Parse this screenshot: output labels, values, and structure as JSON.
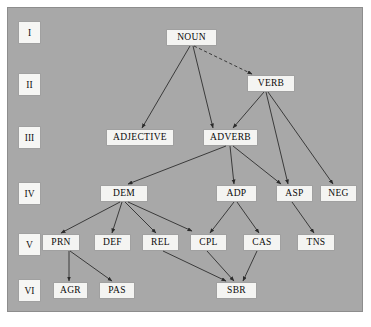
{
  "diagram": {
    "type": "hierarchy-tree",
    "background_color": "#a8a8a8",
    "node_color": "#f4f4f2",
    "line_color": "#2e2e2e",
    "row_labels": [
      {
        "id": "row-1",
        "text": "I",
        "x": 19,
        "y": 22
      },
      {
        "id": "row-2",
        "text": "II",
        "x": 19,
        "y": 74
      },
      {
        "id": "row-3",
        "text": "III",
        "x": 19,
        "y": 127
      },
      {
        "id": "row-4",
        "text": "IV",
        "x": 19,
        "y": 183
      },
      {
        "id": "row-5",
        "text": "V",
        "x": 19,
        "y": 234
      },
      {
        "id": "row-6",
        "text": "VI",
        "x": 19,
        "y": 280
      }
    ],
    "nodes": [
      {
        "id": "noun",
        "label": "NOUN",
        "row": "I",
        "x": 167,
        "y": 30,
        "w": 49,
        "h": 15
      },
      {
        "id": "verb",
        "label": "VERB",
        "row": "II",
        "x": 248,
        "y": 76,
        "w": 46,
        "h": 15
      },
      {
        "id": "adjective",
        "label": "ADJECTIVE",
        "row": "III",
        "x": 107,
        "y": 130,
        "w": 66,
        "h": 15
      },
      {
        "id": "adverb",
        "label": "ADVERB",
        "row": "III",
        "x": 204,
        "y": 130,
        "w": 53,
        "h": 15
      },
      {
        "id": "dem",
        "label": "DEM",
        "row": "IV",
        "x": 101,
        "y": 186,
        "w": 46,
        "h": 15
      },
      {
        "id": "adp",
        "label": "ADP",
        "row": "IV",
        "x": 217,
        "y": 186,
        "w": 39,
        "h": 15
      },
      {
        "id": "asp",
        "label": "ASP",
        "row": "IV",
        "x": 277,
        "y": 186,
        "w": 35,
        "h": 15
      },
      {
        "id": "neg",
        "label": "NEG",
        "row": "IV",
        "x": 321,
        "y": 186,
        "w": 35,
        "h": 15
      },
      {
        "id": "prn",
        "label": "PRN",
        "row": "V",
        "x": 43,
        "y": 235,
        "w": 36,
        "h": 15
      },
      {
        "id": "def",
        "label": "DEF",
        "row": "V",
        "x": 95,
        "y": 235,
        "w": 35,
        "h": 15
      },
      {
        "id": "rel",
        "label": "REL",
        "row": "V",
        "x": 143,
        "y": 235,
        "w": 35,
        "h": 15
      },
      {
        "id": "cpl",
        "label": "CPL",
        "row": "V",
        "x": 191,
        "y": 235,
        "w": 35,
        "h": 15
      },
      {
        "id": "cas",
        "label": "CAS",
        "row": "V",
        "x": 244,
        "y": 235,
        "w": 36,
        "h": 15
      },
      {
        "id": "tns",
        "label": "TNS",
        "row": "V",
        "x": 298,
        "y": 235,
        "w": 36,
        "h": 15
      },
      {
        "id": "agr",
        "label": "AGR",
        "row": "VI",
        "x": 54,
        "y": 283,
        "w": 33,
        "h": 15
      },
      {
        "id": "pas",
        "label": "PAS",
        "row": "VI",
        "x": 100,
        "y": 283,
        "w": 34,
        "h": 15
      },
      {
        "id": "sbr",
        "label": "SBR",
        "row": "VI",
        "x": 217,
        "y": 283,
        "w": 39,
        "h": 15
      }
    ],
    "edges": [
      {
        "id": "edge-noun-verb",
        "from": "noun",
        "to": "verb",
        "style": "dashed",
        "x1": 194,
        "y1": 46,
        "x2": 252,
        "y2": 74
      },
      {
        "id": "edge-noun-adjective",
        "from": "noun",
        "to": "adjective",
        "style": "solid",
        "x1": 190,
        "y1": 46,
        "x2": 142,
        "y2": 128
      },
      {
        "id": "edge-noun-adverb",
        "from": "noun",
        "to": "adverb",
        "style": "solid",
        "x1": 193,
        "y1": 46,
        "x2": 213,
        "y2": 128
      },
      {
        "id": "edge-verb-adverb",
        "from": "verb",
        "to": "adverb",
        "style": "solid",
        "x1": 264,
        "y1": 92,
        "x2": 233,
        "y2": 128
      },
      {
        "id": "edge-verb-asp",
        "from": "verb",
        "to": "asp",
        "style": "solid",
        "x1": 266,
        "y1": 92,
        "x2": 288,
        "y2": 184
      },
      {
        "id": "edge-verb-neg",
        "from": "verb",
        "to": "neg",
        "style": "solid",
        "x1": 268,
        "y1": 92,
        "x2": 333,
        "y2": 184
      },
      {
        "id": "edge-adverb-dem",
        "from": "adverb",
        "to": "dem",
        "style": "solid",
        "x1": 226,
        "y1": 146,
        "x2": 128,
        "y2": 184
      },
      {
        "id": "edge-adverb-adp",
        "from": "adverb",
        "to": "adp",
        "style": "solid",
        "x1": 230,
        "y1": 146,
        "x2": 234,
        "y2": 184
      },
      {
        "id": "edge-adverb-asp",
        "from": "adverb",
        "to": "asp",
        "style": "solid",
        "x1": 233,
        "y1": 146,
        "x2": 281,
        "y2": 184
      },
      {
        "id": "edge-dem-prn",
        "from": "dem",
        "to": "prn",
        "style": "solid",
        "x1": 120,
        "y1": 202,
        "x2": 61,
        "y2": 233
      },
      {
        "id": "edge-dem-def",
        "from": "dem",
        "to": "def",
        "style": "solid",
        "x1": 122,
        "y1": 202,
        "x2": 112,
        "y2": 233
      },
      {
        "id": "edge-dem-rel",
        "from": "dem",
        "to": "rel",
        "style": "solid",
        "x1": 125,
        "y1": 202,
        "x2": 156,
        "y2": 233
      },
      {
        "id": "edge-dem-cpl",
        "from": "dem",
        "to": "cpl",
        "style": "solid",
        "x1": 128,
        "y1": 202,
        "x2": 192,
        "y2": 231
      },
      {
        "id": "edge-adp-cpl",
        "from": "adp",
        "to": "cpl",
        "style": "solid",
        "x1": 234,
        "y1": 202,
        "x2": 210,
        "y2": 233
      },
      {
        "id": "edge-adp-cas",
        "from": "adp",
        "to": "cas",
        "style": "solid",
        "x1": 237,
        "y1": 202,
        "x2": 259,
        "y2": 233
      },
      {
        "id": "edge-asp-tns",
        "from": "asp",
        "to": "tns",
        "style": "solid",
        "x1": 292,
        "y1": 202,
        "x2": 314,
        "y2": 233
      },
      {
        "id": "edge-prn-agr",
        "from": "prn",
        "to": "agr",
        "style": "solid",
        "x1": 69,
        "y1": 251,
        "x2": 69,
        "y2": 281
      },
      {
        "id": "edge-prn-pas",
        "from": "prn",
        "to": "pas",
        "style": "solid",
        "x1": 70,
        "y1": 251,
        "x2": 112,
        "y2": 281
      },
      {
        "id": "edge-rel-sbr",
        "from": "rel",
        "to": "sbr",
        "style": "solid",
        "x1": 163,
        "y1": 251,
        "x2": 226,
        "y2": 281
      },
      {
        "id": "edge-cpl-sbr",
        "from": "cpl",
        "to": "sbr",
        "style": "solid",
        "x1": 207,
        "y1": 251,
        "x2": 234,
        "y2": 281
      },
      {
        "id": "edge-cas-sbr",
        "from": "cas",
        "to": "sbr",
        "style": "solid",
        "x1": 257,
        "y1": 251,
        "x2": 243,
        "y2": 281
      }
    ]
  }
}
